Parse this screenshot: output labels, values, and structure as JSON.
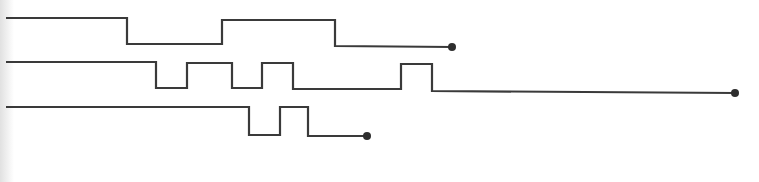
{
  "diagram": {
    "type": "timing-waveforms",
    "stroke_color": "#3a3a3a",
    "dot_color": "#2e2e2e",
    "dot_radius": 4,
    "signals": [
      {
        "name": "signal-1",
        "points": "6,18 127,18 127,44 222,44 222,20 335,20 335,46 452,47",
        "end": {
          "x": 452,
          "y": 47
        }
      },
      {
        "name": "signal-2",
        "points": "6,62 156,62 156,88 187,88 187,63 232,63 232,88 262,88 262,63 293,63 293,89 401,89 401,64 432,64 432,91 735,93",
        "end": {
          "x": 735,
          "y": 93
        }
      },
      {
        "name": "signal-3",
        "points": "6,107 249,107 249,135 280,135 280,107 308,107 308,136 367,136",
        "end": {
          "x": 367,
          "y": 136
        }
      }
    ]
  }
}
